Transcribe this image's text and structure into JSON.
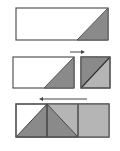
{
  "diagram": {
    "colors": {
      "background": "#ffffff",
      "stroke": "#555555",
      "dark_fill": "#8a8a8a",
      "light_fill": "#b5b5b5",
      "arrow": "#444444"
    },
    "steps": [
      {
        "id": 1,
        "arrow": null
      },
      {
        "id": 2,
        "arrow": "right"
      },
      {
        "id": 3,
        "arrow": "left"
      }
    ]
  }
}
